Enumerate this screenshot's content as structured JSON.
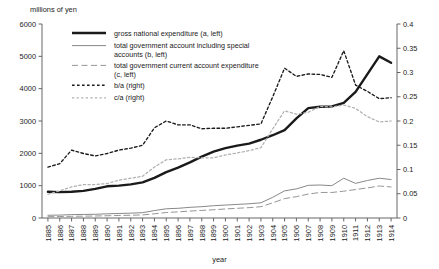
{
  "chart_data": {
    "type": "line",
    "title": "",
    "xlabel": "year",
    "ylabel_left": "millions of yen",
    "ylabel_right": "",
    "ylim_left": [
      0,
      6000
    ],
    "ylim_right": [
      0,
      0.4
    ],
    "yticks_left": [
      "0",
      "1000",
      "2000",
      "3000",
      "4000",
      "5000",
      "6000"
    ],
    "yticks_right": [
      "0",
      "0.05",
      "0.1",
      "0.15",
      "0.2",
      "0.25",
      "0.3",
      "0.35",
      "0.4"
    ],
    "grid": false,
    "legend_position": "top-center",
    "categories": [
      "1885",
      "1886",
      "1887",
      "1888",
      "1889",
      "1890",
      "1891",
      "1892",
      "1893",
      "1894",
      "1895",
      "1896",
      "1897",
      "1898",
      "1899",
      "1900",
      "1901",
      "1902",
      "1903",
      "1904",
      "1905",
      "1906",
      "1907",
      "1908",
      "1909",
      "1910",
      "1911",
      "1912",
      "1913",
      "1914"
    ],
    "series": [
      {
        "name": "gross national expenditure (a, left)",
        "axis": "left",
        "style": "solid-thick",
        "color": "#1a1a1a",
        "values": [
          810,
          800,
          810,
          840,
          900,
          980,
          1000,
          1040,
          1100,
          1240,
          1420,
          1560,
          1720,
          1900,
          2050,
          2160,
          2240,
          2300,
          2420,
          2560,
          2720,
          3080,
          3400,
          3440,
          3450,
          3560,
          3900,
          4450,
          5000,
          4800
        ]
      },
      {
        "name": "total government account including special accounts (b, left)",
        "axis": "left",
        "style": "solid-thin",
        "color": "#7a7a7a",
        "values": [
          85,
          90,
          105,
          110,
          115,
          130,
          140,
          150,
          165,
          230,
          285,
          300,
          330,
          350,
          380,
          400,
          420,
          440,
          470,
          640,
          840,
          900,
          1010,
          1020,
          1000,
          1230,
          1070,
          1160,
          1230,
          1190
        ]
      },
      {
        "name": "total government current account expenditure (c, left)",
        "axis": "left",
        "style": "dashed-thin",
        "color": "#8f8f8f",
        "values": [
          40,
          45,
          52,
          58,
          62,
          70,
          78,
          85,
          95,
          130,
          170,
          190,
          215,
          235,
          255,
          280,
          300,
          320,
          350,
          470,
          600,
          660,
          740,
          790,
          790,
          830,
          880,
          930,
          990,
          960
        ]
      },
      {
        "name": "b/a (right)",
        "axis": "right",
        "style": "dotted-dark",
        "color": "#1a1a1a",
        "values": [
          0.105,
          0.112,
          0.14,
          0.133,
          0.128,
          0.133,
          0.14,
          0.144,
          0.15,
          0.186,
          0.2,
          0.192,
          0.192,
          0.184,
          0.185,
          0.185,
          0.188,
          0.191,
          0.194,
          0.25,
          0.309,
          0.292,
          0.297,
          0.296,
          0.29,
          0.345,
          0.274,
          0.261,
          0.246,
          0.248
        ]
      },
      {
        "name": "c/a (right)",
        "axis": "right",
        "style": "dotted-light",
        "color": "#b0b0b0",
        "values": [
          0.049,
          0.056,
          0.064,
          0.069,
          0.069,
          0.071,
          0.078,
          0.082,
          0.086,
          0.105,
          0.12,
          0.122,
          0.125,
          0.124,
          0.124,
          0.13,
          0.134,
          0.139,
          0.145,
          0.184,
          0.221,
          0.214,
          0.218,
          0.23,
          0.229,
          0.233,
          0.226,
          0.209,
          0.198,
          0.2
        ]
      }
    ]
  },
  "legend": {
    "items": [
      {
        "label": "gross national expenditure (a, left)",
        "swatch": "solid-thick"
      },
      {
        "label": "total government account including special",
        "label2": "accounts (b, left)",
        "swatch": "solid-thin"
      },
      {
        "label": "total government current account expenditure",
        "label2": "(c, left)",
        "swatch": "dashed-thin"
      },
      {
        "label": "b/a (right)",
        "swatch": "dotted-dark"
      },
      {
        "label": "c/a (right)",
        "swatch": "dotted-light"
      }
    ]
  }
}
